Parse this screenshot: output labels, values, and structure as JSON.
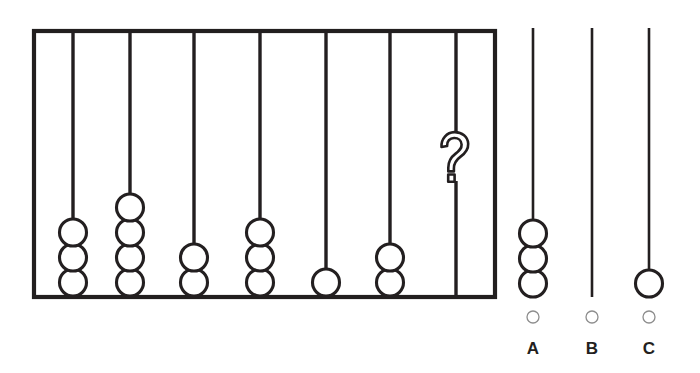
{
  "puzzle": {
    "title": "Abacus bead-count sequence puzzle",
    "question_symbol": "?",
    "frame": {
      "x": 34,
      "y": 31,
      "width": 461,
      "height": 266
    },
    "rods": [
      {
        "name": "rod-1",
        "x": 73,
        "beads": 3
      },
      {
        "name": "rod-2",
        "x": 130,
        "beads": 4
      },
      {
        "name": "rod-3",
        "x": 194,
        "beads": 2
      },
      {
        "name": "rod-4",
        "x": 260,
        "beads": 3
      },
      {
        "name": "rod-5",
        "x": 326,
        "beads": 1
      },
      {
        "name": "rod-6",
        "x": 390,
        "beads": 2
      },
      {
        "name": "rod-7",
        "x": 456,
        "beads": 0,
        "unknown": true
      }
    ],
    "bead_radius": 13.5,
    "bead_pitch": 25,
    "rod_top": 31,
    "rod_bottom": 296
  },
  "options": [
    {
      "id": "A",
      "label": "A",
      "x": 533,
      "beads": 3,
      "rod_top": 28,
      "rod_bottom": 297,
      "selected": false
    },
    {
      "id": "B",
      "label": "B",
      "x": 592,
      "beads": 0,
      "rod_top": 28,
      "rod_bottom": 297,
      "selected": false
    },
    {
      "id": "C",
      "label": "C",
      "x": 649,
      "beads": 1,
      "rod_top": 28,
      "rod_bottom": 297,
      "selected": false
    }
  ],
  "option_row": {
    "radio_y": 317,
    "radio_radius": 6,
    "label_y": 354
  },
  "colors": {
    "ink": "#231f20",
    "frame": "#221f1f",
    "radio_stroke": "#8d8d8d",
    "background": "#ffffff"
  }
}
